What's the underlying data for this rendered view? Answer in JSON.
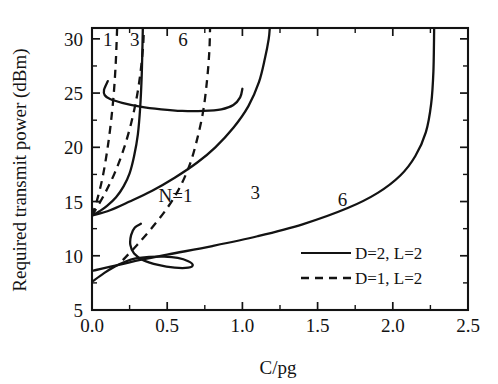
{
  "chart_data": {
    "type": "line",
    "title": "",
    "xlabel": "C/pg",
    "ylabel": "Required transmit power (dBm)",
    "xlim": [
      0.0,
      2.5
    ],
    "ylim": [
      5,
      31
    ],
    "grid": false,
    "x_ticks": [
      "0.0",
      "0.5",
      "1.0",
      "1.5",
      "2.0",
      "2.5"
    ],
    "x_tick_values": [
      0.0,
      0.5,
      1.0,
      1.5,
      2.0,
      2.5
    ],
    "x_minor_tick_values": [
      0.25,
      0.75,
      1.25,
      1.75,
      2.25
    ],
    "y_ticks": [
      "5",
      "10",
      "15",
      "20",
      "25",
      "30"
    ],
    "y_tick_values": [
      5,
      10,
      15,
      20,
      25,
      30
    ],
    "y_minor_tick_values": [
      7.5,
      12.5,
      17.5,
      22.5,
      27.5
    ],
    "legend_position": "lower-right",
    "legend": [
      {
        "label": "D=2, L=2",
        "style": "solid"
      },
      {
        "label": "D=1, L=2",
        "style": "dashed"
      }
    ],
    "annotations": [
      {
        "text": "1",
        "x": 0.105,
        "y": 29.3,
        "series": "N=1 dashed branch label"
      },
      {
        "text": "3",
        "x": 0.285,
        "y": 29.3,
        "series": "N=3 dashed branch label"
      },
      {
        "text": "6",
        "x": 0.605,
        "y": 29.3,
        "series": "N=6 dashed branch label"
      },
      {
        "text": "N=1",
        "x": 0.555,
        "y": 15.0,
        "series": "N=1 solid branch label"
      },
      {
        "text": "3",
        "x": 1.085,
        "y": 15.2,
        "series": "N=3 solid branch label"
      },
      {
        "text": "6",
        "x": 1.665,
        "y": 14.6,
        "series": "N=6 solid branch label"
      }
    ],
    "series": [
      {
        "name": "D=2, L=2, N=1",
        "style": "solid",
        "points": [
          [
            0.0,
            13.7
          ],
          [
            0.05,
            14.1
          ],
          [
            0.1,
            14.6
          ],
          [
            0.16,
            15.4
          ],
          [
            0.21,
            16.4
          ],
          [
            0.25,
            17.6
          ],
          [
            0.28,
            19.2
          ],
          [
            0.305,
            21.2
          ],
          [
            0.32,
            23.6
          ],
          [
            0.33,
            26.4
          ],
          [
            0.335,
            29.0
          ],
          [
            0.338,
            31.0
          ]
        ]
      },
      {
        "name": "D=2, L=2, N=3",
        "style": "solid",
        "points": [
          [
            0.0,
            13.7
          ],
          [
            0.12,
            14.2
          ],
          [
            0.25,
            15.0
          ],
          [
            0.4,
            16.0
          ],
          [
            0.55,
            17.2
          ],
          [
            0.7,
            18.6
          ],
          [
            0.82,
            20.0
          ],
          [
            0.94,
            21.8
          ],
          [
            1.04,
            23.8
          ],
          [
            1.11,
            26.0
          ],
          [
            1.15,
            28.2
          ],
          [
            1.175,
            30.0
          ],
          [
            1.182,
            31.0
          ]
        ]
      },
      {
        "name": "D=2, L=2, N=6",
        "style": "solid",
        "points": [
          [
            0.0,
            8.6
          ],
          [
            0.25,
            9.4
          ],
          [
            0.5,
            10.1
          ],
          [
            0.8,
            10.9
          ],
          [
            1.1,
            11.8
          ],
          [
            1.4,
            12.9
          ],
          [
            1.7,
            14.4
          ],
          [
            1.9,
            15.8
          ],
          [
            2.05,
            17.4
          ],
          [
            2.15,
            19.2
          ],
          [
            2.22,
            21.4
          ],
          [
            2.255,
            24.0
          ],
          [
            2.27,
            27.0
          ],
          [
            2.275,
            31.0
          ]
        ]
      },
      {
        "name": "D=2, L=2 upper boundary arc",
        "style": "solid",
        "points": [
          [
            0.105,
            26.1
          ],
          [
            0.08,
            25.3
          ],
          [
            0.085,
            24.8
          ],
          [
            0.12,
            24.45
          ],
          [
            0.2,
            24.1
          ],
          [
            0.32,
            23.75
          ],
          [
            0.46,
            23.5
          ],
          [
            0.6,
            23.35
          ],
          [
            0.74,
            23.35
          ],
          [
            0.86,
            23.5
          ],
          [
            0.94,
            23.9
          ],
          [
            0.985,
            24.6
          ],
          [
            1.0,
            25.4
          ]
        ]
      },
      {
        "name": "D=2, L=2 low-left fold",
        "style": "solid",
        "points": [
          [
            0.0,
            7.6
          ],
          [
            0.08,
            8.4
          ],
          [
            0.15,
            9.0
          ],
          [
            0.22,
            9.45
          ],
          [
            0.29,
            9.75
          ],
          [
            0.38,
            9.9
          ],
          [
            0.48,
            9.92
          ],
          [
            0.57,
            9.8
          ],
          [
            0.64,
            9.5
          ],
          [
            0.67,
            9.15
          ],
          [
            0.64,
            8.9
          ],
          [
            0.55,
            8.9
          ],
          [
            0.44,
            9.15
          ],
          [
            0.34,
            9.6
          ],
          [
            0.28,
            10.2
          ],
          [
            0.255,
            11.0
          ],
          [
            0.26,
            11.9
          ],
          [
            0.285,
            12.6
          ],
          [
            0.325,
            12.95
          ]
        ]
      },
      {
        "name": "D=1, L=2, N=1",
        "style": "dashed",
        "points": [
          [
            0.0,
            13.7
          ],
          [
            0.035,
            15.2
          ],
          [
            0.07,
            17.2
          ],
          [
            0.1,
            19.6
          ],
          [
            0.125,
            22.2
          ],
          [
            0.145,
            25.0
          ],
          [
            0.158,
            27.8
          ],
          [
            0.165,
            30.2
          ],
          [
            0.167,
            31.0
          ]
        ]
      },
      {
        "name": "D=1, L=2, N=3",
        "style": "dashed",
        "points": [
          [
            0.0,
            13.7
          ],
          [
            0.08,
            15.6
          ],
          [
            0.15,
            17.6
          ],
          [
            0.21,
            19.8
          ],
          [
            0.26,
            22.2
          ],
          [
            0.3,
            24.8
          ],
          [
            0.325,
            27.2
          ],
          [
            0.34,
            29.4
          ],
          [
            0.345,
            31.0
          ]
        ]
      },
      {
        "name": "D=1, L=2, N=6",
        "style": "dashed",
        "points": [
          [
            0.205,
            9.6
          ],
          [
            0.3,
            11.0
          ],
          [
            0.4,
            12.6
          ],
          [
            0.5,
            14.4
          ],
          [
            0.58,
            16.2
          ],
          [
            0.65,
            18.4
          ],
          [
            0.7,
            20.8
          ],
          [
            0.74,
            23.4
          ],
          [
            0.765,
            26.2
          ],
          [
            0.78,
            28.8
          ],
          [
            0.785,
            31.0
          ]
        ]
      }
    ]
  },
  "figure": {
    "y_axis_title": "Required transmit power (dBm)",
    "x_axis_title": "C/pg"
  }
}
